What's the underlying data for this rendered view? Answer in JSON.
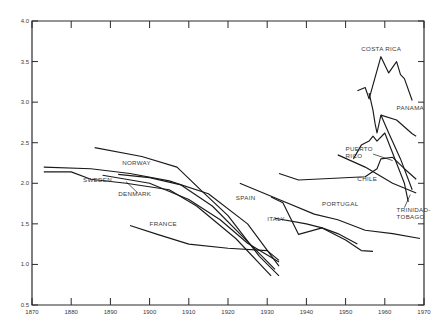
{
  "chart_data": {
    "type": "line",
    "title": "",
    "xlabel": "",
    "ylabel": "",
    "xlim": [
      1870,
      1970
    ],
    "ylim": [
      0.5,
      4.0
    ],
    "grid": false,
    "legend": "inline labels",
    "x_ticks": [
      1870,
      1880,
      1890,
      1900,
      1910,
      1920,
      1930,
      1940,
      1950,
      1960,
      1970
    ],
    "x_tick_labels": [
      "1870",
      "1880",
      "1890",
      "1900",
      "1910",
      "1920",
      "1930",
      "1940",
      "1950",
      "1960",
      "1970"
    ],
    "y_ticks": [
      0.5,
      1.0,
      1.5,
      2.0,
      2.5,
      3.0,
      3.5,
      4.0
    ],
    "y_tick_labels": [
      "0.5",
      "1.0",
      "1.5",
      "2.0",
      "2.5",
      "3.0",
      "3.5",
      "4.0"
    ],
    "series": [
      {
        "name": "NORWAY",
        "points": [
          [
            1873,
            2.2
          ],
          [
            1885,
            2.18
          ],
          [
            1895,
            2.12
          ],
          [
            1905,
            2.03
          ],
          [
            1915,
            1.87
          ],
          [
            1925,
            1.5
          ],
          [
            1933,
            0.98
          ]
        ]
      },
      {
        "name": "SWEDEN",
        "points": [
          [
            1873,
            2.14
          ],
          [
            1880,
            2.14
          ],
          [
            1885,
            2.05
          ],
          [
            1894,
            2.0
          ],
          [
            1905,
            1.92
          ],
          [
            1912,
            1.72
          ],
          [
            1922,
            1.32
          ],
          [
            1931,
            0.86
          ]
        ]
      },
      {
        "name": "DENMARK",
        "points": [
          [
            1892,
            2.11
          ],
          [
            1900,
            2.07
          ],
          [
            1908,
            1.98
          ],
          [
            1916,
            1.72
          ],
          [
            1924,
            1.33
          ],
          [
            1932,
            0.94
          ]
        ]
      },
      {
        "name": "FINLAND (unlabeled)",
        "points": [
          [
            1886,
            2.44
          ],
          [
            1898,
            2.33
          ],
          [
            1907,
            2.2
          ],
          [
            1913,
            1.92
          ],
          [
            1920,
            1.6
          ],
          [
            1928,
            1.1
          ],
          [
            1933,
            0.86
          ]
        ]
      },
      {
        "name": "FRANCE",
        "points": [
          [
            1895,
            1.48
          ],
          [
            1902,
            1.37
          ],
          [
            1910,
            1.25
          ],
          [
            1920,
            1.2
          ],
          [
            1930,
            1.17
          ],
          [
            1933,
            1.05
          ]
        ]
      },
      {
        "name": "UNLABELED-1",
        "points": [
          [
            1888,
            2.1
          ],
          [
            1900,
            2.0
          ],
          [
            1910,
            1.8
          ],
          [
            1918,
            1.55
          ],
          [
            1925,
            1.26
          ],
          [
            1933,
            1.03
          ]
        ]
      },
      {
        "name": "SPAIN",
        "points": [
          [
            1923,
            2.0
          ],
          [
            1933,
            1.8
          ],
          [
            1942,
            1.62
          ],
          [
            1948,
            1.55
          ],
          [
            1955,
            1.42
          ],
          [
            1962,
            1.38
          ],
          [
            1969,
            1.32
          ]
        ]
      },
      {
        "name": "ITALY",
        "points": [
          [
            1932,
            1.57
          ],
          [
            1940,
            1.5
          ],
          [
            1944,
            1.45
          ],
          [
            1948,
            1.38
          ],
          [
            1953,
            1.25
          ]
        ]
      },
      {
        "name": "PORTUGAL",
        "points": [
          [
            1931,
            1.83
          ],
          [
            1934,
            1.76
          ],
          [
            1938,
            1.37
          ],
          [
            1944,
            1.45
          ],
          [
            1950,
            1.3
          ],
          [
            1954,
            1.17
          ],
          [
            1957,
            1.16
          ]
        ]
      },
      {
        "name": "CHILE",
        "points": [
          [
            1933,
            2.12
          ],
          [
            1938,
            2.04
          ],
          [
            1955,
            2.08
          ],
          [
            1958,
            2.18
          ],
          [
            1959,
            2.3
          ],
          [
            1962,
            2.32
          ],
          [
            1965,
            2.18
          ],
          [
            1968,
            2.05
          ]
        ]
      },
      {
        "name": "PUERTO RICO",
        "points": [
          [
            1948,
            2.35
          ],
          [
            1955,
            2.2
          ],
          [
            1962,
            2.0
          ],
          [
            1968,
            1.88
          ]
        ]
      },
      {
        "name": "PANAMA",
        "points": [
          [
            1959,
            2.84
          ],
          [
            1963,
            2.78
          ],
          [
            1967,
            2.61
          ],
          [
            1968,
            2.58
          ]
        ]
      },
      {
        "name": "COSTA RICA",
        "points": [
          [
            1953,
            3.14
          ],
          [
            1955,
            3.18
          ],
          [
            1956,
            3.04
          ],
          [
            1959,
            3.56
          ],
          [
            1961,
            3.36
          ],
          [
            1963,
            3.5
          ],
          [
            1964,
            3.34
          ],
          [
            1965,
            3.29
          ],
          [
            1967,
            3.02
          ]
        ]
      },
      {
        "name": "UNLABELED-2",
        "points": [
          [
            1956,
            3.11
          ],
          [
            1957,
            2.9
          ],
          [
            1957.5,
            2.74
          ],
          [
            1958,
            2.62
          ],
          [
            1959,
            2.84
          ],
          [
            1961,
            2.62
          ],
          [
            1964,
            2.3
          ],
          [
            1967,
            1.92
          ]
        ]
      },
      {
        "name": "TRINIDAD-TOBAGO",
        "points": [
          [
            1952,
            2.3
          ],
          [
            1954,
            2.47
          ],
          [
            1956,
            2.52
          ],
          [
            1957,
            2.58
          ],
          [
            1958,
            2.52
          ],
          [
            1960,
            2.62
          ],
          [
            1965,
            2.0
          ],
          [
            1966,
            1.77
          ]
        ]
      }
    ],
    "annotations": [
      {
        "text": "NORWAY",
        "x": 1893,
        "y": 2.22
      },
      {
        "text": "SWEDEN",
        "x": 1883,
        "y": 2.02
      },
      {
        "text": "DENMARK",
        "x": 1892,
        "y": 1.84
      },
      {
        "text": "FRANCE",
        "x": 1900,
        "y": 1.47
      },
      {
        "text": "SPAIN",
        "x": 1922,
        "y": 1.8
      },
      {
        "text": "ITALY",
        "x": 1930,
        "y": 1.53
      },
      {
        "text": "PORTUGAL",
        "x": 1944,
        "y": 1.72
      },
      {
        "text": "CHILE",
        "x": 1953,
        "y": 2.03
      },
      {
        "text": "PUERTO RICO",
        "x": 1950,
        "y": 2.4
      },
      {
        "text": "PANAMA",
        "x": 1963,
        "y": 2.9
      },
      {
        "text": "COSTA RICA",
        "x": 1954,
        "y": 3.63
      },
      {
        "text": "TRINIDAD-TOBAGO",
        "x": 1963,
        "y": 1.65
      }
    ]
  }
}
